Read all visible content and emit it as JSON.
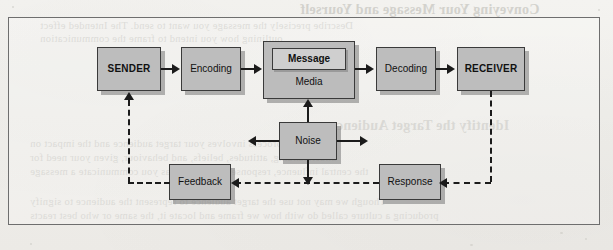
{
  "page": {
    "kind": "scanned-textbook-figure",
    "background_color": "#f2f1ee",
    "frame_border_color": "#6e6e6e"
  },
  "ghost_text": {
    "note": "faint mirrored bleed-through from the reverse side of the scanned page",
    "lines": [
      {
        "text": "Conveying Your Message and Yourself",
        "x": 300,
        "y": 2,
        "size": "big"
      },
      {
        "text": "Describe precisely the message you want to send. The Intended effect",
        "x": 40,
        "y": 20,
        "size": "body"
      },
      {
        "text": "outlining how you intend to frame the communication",
        "x": 40,
        "y": 33,
        "size": "body"
      },
      {
        "text": "Identify the Target Audience",
        "x": 330,
        "y": 118,
        "size": "big"
      },
      {
        "text": "The process involves your target audience and the impact on",
        "x": 30,
        "y": 138,
        "size": "body"
      },
      {
        "text": "understanding, attitudes, beliefs, and behaviour, given your need for",
        "x": 30,
        "y": 152,
        "size": "body"
      },
      {
        "text": "the central influence, response and reaction as you communicate a message",
        "x": 30,
        "y": 166,
        "size": "body"
      },
      {
        "text": "Though we may not use the target audience to represent the audience to signify",
        "x": 30,
        "y": 196,
        "size": "body"
      },
      {
        "text": "producing a culture called do with how we frame and locate it, the same or who best reacts",
        "x": 30,
        "y": 210,
        "size": "body"
      }
    ]
  },
  "diagram": {
    "node_fill": "#bdbdbd",
    "node_border": "#3a3a3a",
    "nodes": [
      {
        "id": "sender",
        "label": "SENDER",
        "bold": true,
        "x": 96,
        "y": 46,
        "w": 64,
        "h": 44
      },
      {
        "id": "encoding",
        "label": "Encoding",
        "bold": false,
        "x": 180,
        "y": 46,
        "w": 60,
        "h": 44
      },
      {
        "id": "media",
        "label": "Media",
        "bold": false,
        "x": 262,
        "y": 40,
        "w": 92,
        "h": 58
      },
      {
        "id": "message",
        "label": "Message",
        "bold": true,
        "x": 0,
        "y": 0,
        "w": 74,
        "h": 22
      },
      {
        "id": "decoding",
        "label": "Decoding",
        "bold": false,
        "x": 375,
        "y": 46,
        "w": 60,
        "h": 44
      },
      {
        "id": "receiver",
        "label": "RECEIVER",
        "bold": true,
        "x": 456,
        "y": 46,
        "w": 68,
        "h": 44
      },
      {
        "id": "noise",
        "label": "Noise",
        "bold": false,
        "x": 278,
        "y": 121,
        "w": 58,
        "h": 38
      },
      {
        "id": "feedback",
        "label": "Feedback",
        "bold": false,
        "x": 168,
        "y": 163,
        "w": 62,
        "h": 36
      },
      {
        "id": "response",
        "label": "Response",
        "bold": false,
        "x": 378,
        "y": 163,
        "w": 62,
        "h": 36
      }
    ],
    "flows": [
      {
        "from": "sender",
        "to": "encoding",
        "style": "solid",
        "direction": "right"
      },
      {
        "from": "encoding",
        "to": "media",
        "style": "solid",
        "direction": "right"
      },
      {
        "from": "media",
        "to": "decoding",
        "style": "solid",
        "direction": "right"
      },
      {
        "from": "decoding",
        "to": "receiver",
        "style": "solid",
        "direction": "right"
      },
      {
        "from": "noise",
        "to": "media",
        "style": "solid",
        "direction": "up"
      },
      {
        "from": "noise",
        "to": "left",
        "style": "solid",
        "direction": "left"
      },
      {
        "from": "noise",
        "to": "right",
        "style": "solid",
        "direction": "right"
      },
      {
        "from": "noise",
        "to": "down",
        "style": "solid",
        "direction": "down"
      },
      {
        "from": "receiver",
        "to": "response",
        "style": "dashed",
        "direction": "down-left"
      },
      {
        "from": "response",
        "to": "feedback",
        "style": "dashed",
        "direction": "left"
      },
      {
        "from": "feedback",
        "to": "sender",
        "style": "dashed",
        "direction": "left-up"
      }
    ]
  }
}
